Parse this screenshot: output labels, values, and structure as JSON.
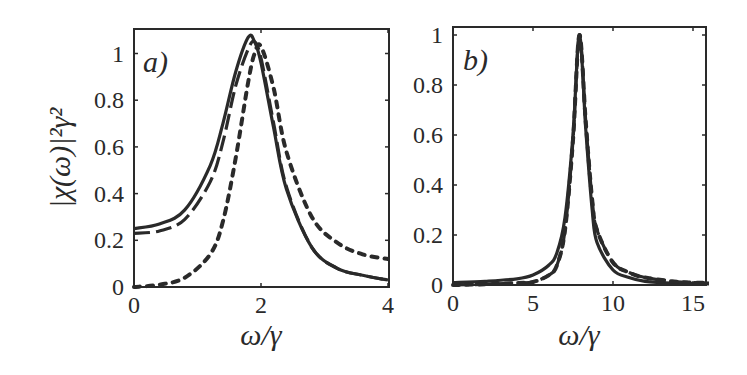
{
  "chart_data": [
    {
      "type": "line",
      "panel_label": "a)",
      "xlabel": "ω/γ",
      "ylabel": "|χ(ω)|²γ²",
      "xlim": [
        0,
        4
      ],
      "ylim": [
        0,
        1.1
      ],
      "xticks": [
        0,
        2,
        4
      ],
      "xtick_labels": [
        "0",
        "2",
        "4"
      ],
      "yticks": [
        0,
        0.2,
        0.4,
        0.6,
        0.8,
        1
      ],
      "ytick_labels": [
        "0",
        "0.2",
        "0.4",
        "0.6",
        "0.8",
        "1"
      ],
      "grid": false,
      "legend": "none",
      "x": [
        0,
        0.4,
        0.8,
        1.2,
        1.4,
        1.6,
        1.8,
        1.9,
        2.0,
        2.2,
        2.4,
        2.8,
        3.2,
        3.6,
        4.0
      ],
      "series": [
        {
          "name": "solid",
          "style": "solid",
          "values": [
            0.25,
            0.27,
            0.33,
            0.52,
            0.7,
            0.92,
            1.07,
            1.05,
            0.96,
            0.68,
            0.42,
            0.17,
            0.08,
            0.05,
            0.03
          ]
        },
        {
          "name": "dashed",
          "style": "dashed",
          "values": [
            0.23,
            0.24,
            0.29,
            0.45,
            0.62,
            0.86,
            1.02,
            1.05,
            0.98,
            0.7,
            0.43,
            0.17,
            0.08,
            0.05,
            0.03
          ]
        },
        {
          "name": "dotted",
          "style": "dotted",
          "values": [
            0.0,
            0.01,
            0.04,
            0.14,
            0.28,
            0.55,
            0.88,
            1.0,
            1.03,
            0.85,
            0.58,
            0.3,
            0.19,
            0.14,
            0.12
          ]
        }
      ]
    },
    {
      "type": "line",
      "panel_label": "b)",
      "xlabel": "ω/γ",
      "ylabel": "",
      "xlim": [
        0,
        16
      ],
      "ylim": [
        0,
        1.0
      ],
      "xticks": [
        0,
        5,
        10,
        15
      ],
      "xtick_labels": [
        "0",
        "5",
        "10",
        "15"
      ],
      "yticks": [
        0,
        0.2,
        0.4,
        0.6,
        0.8,
        1
      ],
      "ytick_labels": [
        "0",
        "0.2",
        "0.4",
        "0.6",
        "0.8",
        "1"
      ],
      "grid": false,
      "legend": "none",
      "x": [
        0,
        2,
        4,
        5,
        6,
        6.5,
        7,
        7.5,
        7.9,
        8.3,
        8.7,
        9,
        10,
        11,
        12,
        14,
        16
      ],
      "series": [
        {
          "name": "solid",
          "style": "solid",
          "values": [
            0.01,
            0.015,
            0.025,
            0.04,
            0.08,
            0.13,
            0.27,
            0.6,
            1.0,
            0.62,
            0.3,
            0.17,
            0.06,
            0.03,
            0.015,
            0.007,
            0.005
          ]
        },
        {
          "name": "dashed",
          "style": "dashed",
          "values": [
            0.0,
            0.003,
            0.008,
            0.012,
            0.04,
            0.08,
            0.22,
            0.58,
            1.0,
            0.65,
            0.34,
            0.22,
            0.09,
            0.05,
            0.03,
            0.013,
            0.008
          ]
        },
        {
          "name": "dotted",
          "style": "dotted",
          "values": [
            0.0,
            0.003,
            0.008,
            0.012,
            0.04,
            0.08,
            0.22,
            0.58,
            1.0,
            0.65,
            0.34,
            0.22,
            0.09,
            0.05,
            0.03,
            0.013,
            0.008
          ]
        }
      ]
    }
  ],
  "colors": {
    "line": "#2a2a2a",
    "background": "#ffffff"
  }
}
